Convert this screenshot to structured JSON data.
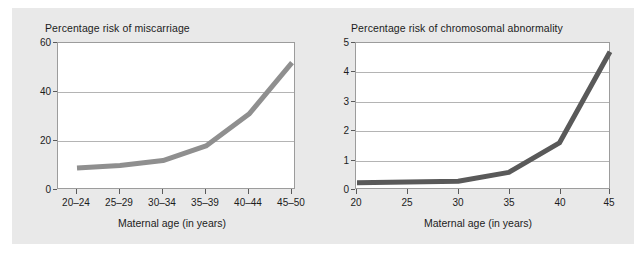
{
  "figure": {
    "background_color": "#e9e9e9",
    "plot_background_color": "#ffffff",
    "frame_color": "#9c9c9c",
    "gridline_color": "#b4b4b4"
  },
  "chart_data": [
    {
      "id": "miscarriage",
      "type": "line",
      "title": "Percentage risk of miscarriage",
      "xlabel": "Maternal age (in years)",
      "ylabel": "",
      "categories": [
        "20–24",
        "25–29",
        "30–34",
        "35–39",
        "40–44",
        "45–50"
      ],
      "values": [
        9,
        10,
        12,
        18,
        31,
        52
      ],
      "ylim": [
        0,
        60
      ],
      "yticks": [
        0,
        20,
        40,
        60
      ],
      "ytick_labels": [
        "0",
        "20",
        "40",
        "60"
      ],
      "grid": true,
      "legend": "none",
      "line_color": "#8f8f8f",
      "line_width": 5
    },
    {
      "id": "chromosomal-abnormality",
      "type": "line",
      "title": "Percentage risk of chromosomal abnormality",
      "xlabel": "Maternal age (in years)",
      "ylabel": "",
      "categories": [
        "20",
        "25",
        "30",
        "35",
        "40",
        "45"
      ],
      "x": [
        20,
        25,
        30,
        35,
        40,
        45
      ],
      "values": [
        0.25,
        0.27,
        0.3,
        0.6,
        1.6,
        4.7
      ],
      "ylim": [
        0,
        5
      ],
      "xlim": [
        20,
        45
      ],
      "yticks": [
        0,
        1,
        2,
        3,
        4,
        5
      ],
      "ytick_labels": [
        "0",
        "1",
        "2",
        "3",
        "4",
        "5"
      ],
      "grid": true,
      "legend": "none",
      "line_color": "#595959",
      "line_width": 5
    }
  ]
}
